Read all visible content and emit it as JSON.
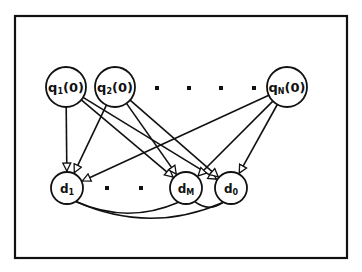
{
  "diagram": {
    "type": "bipartite-graph",
    "stroke_color": "#111111",
    "background": "#ffffff",
    "frame": {
      "x": 15,
      "y": 16,
      "width": 332,
      "height": 242
    },
    "top_nodes": [
      {
        "id": "q1",
        "base": "q",
        "sub": "1",
        "suffix": "(0)",
        "cx": 66,
        "cy": 87,
        "r": 20
      },
      {
        "id": "q2",
        "base": "q",
        "sub": "2",
        "suffix": "(0)",
        "cx": 115,
        "cy": 87,
        "r": 20
      },
      {
        "id": "qN",
        "base": "q",
        "sub": "N",
        "suffix": "(0)",
        "cx": 287,
        "cy": 87,
        "r": 20
      }
    ],
    "top_ellipsis_dots": [
      {
        "cx": 157,
        "cy": 88
      },
      {
        "cx": 189,
        "cy": 88
      },
      {
        "cx": 221,
        "cy": 88
      },
      {
        "cx": 254,
        "cy": 88
      }
    ],
    "bottom_nodes": [
      {
        "id": "d1",
        "base": "d",
        "sub": "1",
        "cx": 67,
        "cy": 188,
        "r": 16
      },
      {
        "id": "dM",
        "base": "d",
        "sub": "M",
        "cx": 186,
        "cy": 188,
        "r": 16
      },
      {
        "id": "d0",
        "base": "d",
        "sub": "0",
        "cx": 231,
        "cy": 188,
        "r": 16
      }
    ],
    "bottom_ellipsis_dots": [
      {
        "cx": 107,
        "cy": 188
      },
      {
        "cx": 141,
        "cy": 188
      }
    ],
    "edges": [
      {
        "from": "q1",
        "to": "d1"
      },
      {
        "from": "q1",
        "to": "dM"
      },
      {
        "from": "q1",
        "to": "d0"
      },
      {
        "from": "q2",
        "to": "d1"
      },
      {
        "from": "q2",
        "to": "dM"
      },
      {
        "from": "q2",
        "to": "d0"
      },
      {
        "from": "qN",
        "to": "d1"
      },
      {
        "from": "qN",
        "to": "dM"
      },
      {
        "from": "qN",
        "to": "d0"
      }
    ],
    "arcs": [
      {
        "from": "d1",
        "to": "dM"
      },
      {
        "from": "d1",
        "to": "d0"
      },
      {
        "from": "dM",
        "to": "d0"
      }
    ]
  }
}
